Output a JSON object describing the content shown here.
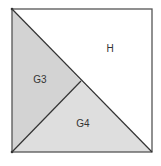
{
  "diagram": {
    "type": "square-dissection",
    "square": {
      "x1": 12,
      "y1": 9,
      "x2": 152,
      "y2": 152
    },
    "colors": {
      "stroke": "#555555",
      "G3": "#d3d3d3",
      "G4": "#dedede",
      "H": "#ffffff"
    },
    "regions": [
      {
        "id": "H",
        "label": "H",
        "points": "12,9 152,9 152,152",
        "label_pos": [
          110,
          52
        ]
      },
      {
        "id": "G3",
        "label": "G3",
        "points": "12,9 81,81 12,152",
        "label_pos": [
          40,
          83
        ]
      },
      {
        "id": "G4",
        "label": "G4",
        "points": "12,152 81,81 152,152",
        "label_pos": [
          83,
          127
        ]
      }
    ]
  }
}
